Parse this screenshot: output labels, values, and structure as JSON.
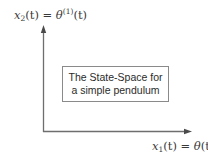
{
  "diagram": {
    "y_axis": {
      "label_var": "x",
      "label_sub": "2",
      "label_arg": "(t) = ",
      "label_theta": "θ",
      "label_sup": "(1)",
      "label_tail": "(t)"
    },
    "x_axis": {
      "label_var": "x",
      "label_sub": "1",
      "label_arg": "(t) = ",
      "label_theta": "θ",
      "label_tail": "(t)"
    },
    "caption": {
      "line1": "The State-Space for",
      "line2": "a simple pendulum"
    },
    "colors": {
      "axis": "#6e6e6e",
      "box_border": "#8a8a8a",
      "text": "#2b2b2b"
    }
  }
}
